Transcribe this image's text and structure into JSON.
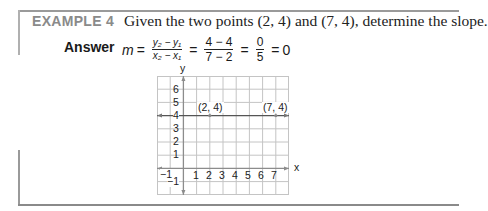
{
  "example": {
    "label": "EXAMPLE 4",
    "prompt": "Given the two points (2, 4) and (7, 4), determine the slope."
  },
  "answer": {
    "label": "Answer",
    "lhs": "m",
    "equals": "=",
    "formula": {
      "num": "y₂ − y₁",
      "den": "x₂ − x₁"
    },
    "substituted": {
      "num": "4 − 4",
      "den": "7 − 2"
    },
    "simplified": {
      "num": "0",
      "den": "5"
    },
    "result": "0"
  },
  "graph": {
    "x_axis_label": "x",
    "y_axis_label": "y",
    "x_ticks": [
      "−1",
      "1",
      "2",
      "3",
      "4",
      "5",
      "6",
      "7"
    ],
    "y_ticks": [
      "6",
      "5",
      "4",
      "3",
      "2",
      "1",
      "−1"
    ],
    "points": [
      {
        "label": "(2, 4)",
        "x": 2,
        "y": 4
      },
      {
        "label": "(7, 4)",
        "x": 7,
        "y": 4
      }
    ],
    "line": {
      "equation": "y = 4",
      "slope": 0
    },
    "x_range": [
      -2,
      8
    ],
    "y_range": [
      -2,
      7
    ],
    "grid_color": "#bdbdbd",
    "axis_color": "#888888"
  }
}
